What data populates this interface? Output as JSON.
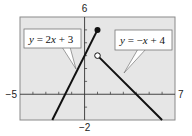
{
  "chart_data": {
    "type": "line",
    "title": "",
    "xlabel": "",
    "ylabel": "",
    "xlim": [
      -5,
      7
    ],
    "ylim": [
      -2,
      6
    ],
    "grid": false,
    "tick_step": 1,
    "axis_end_labels": {
      "x_min": "−5",
      "x_max": "7",
      "y_min": "−2",
      "y_max": "6"
    },
    "series": [
      {
        "name": "y = 2x + 3",
        "equation": "y = 2x + 3",
        "x": [
          -2.5,
          1
        ],
        "y": [
          -2,
          5
        ],
        "endpoint": {
          "x": 1,
          "y": 5,
          "style": "closed"
        }
      },
      {
        "name": "y = −x + 4",
        "equation": "y = −x + 4",
        "x": [
          1,
          6
        ],
        "y": [
          3,
          -2
        ],
        "endpoint": {
          "x": 1,
          "y": 3,
          "style": "open"
        }
      }
    ],
    "annotations": [
      {
        "text": "y = 2x + 3",
        "points_to_series": 0
      },
      {
        "text": "y = −x + 4",
        "points_to_series": 1
      }
    ]
  },
  "colors": {
    "plot_background": "#e6e6e6",
    "frame": "#8a8a8a",
    "line": "#111111",
    "axis": "#333333"
  },
  "labels": {
    "eq1": {
      "lhs": "y",
      "eq": " = 2",
      "var": "x",
      "rest": " + 3"
    },
    "eq2": {
      "lhs": "y",
      "eq": " = −",
      "var": "x",
      "rest": " + 4"
    }
  }
}
